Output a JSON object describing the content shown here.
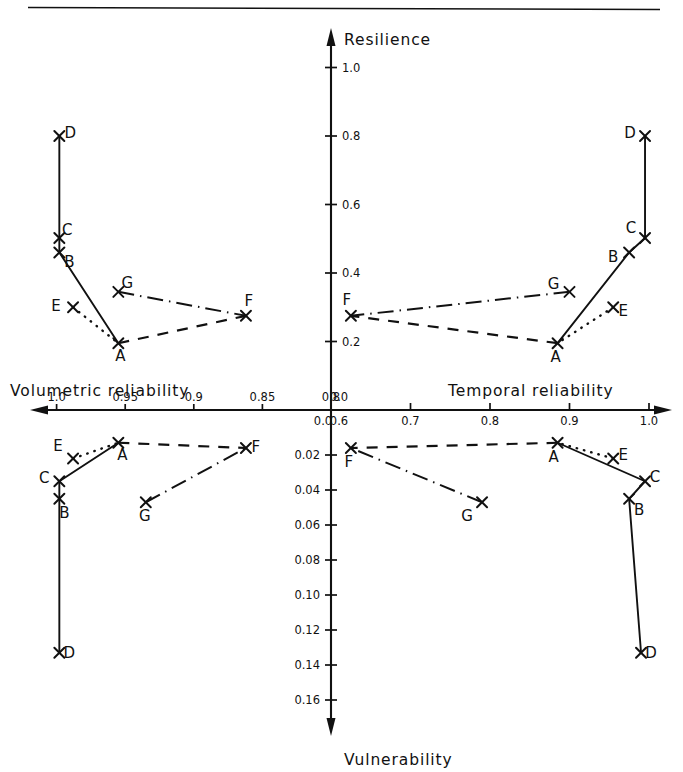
{
  "figure": {
    "title_resilience_axis": "Resilience",
    "title_vulnerability_axis": "Vulnerability",
    "title_left_x_axis": "Volumetric reliability",
    "title_right_x_axis": "Temporal reliability"
  },
  "axes": {
    "x_left_ticks": [
      "1.0",
      "0.95",
      "0.9",
      "0.85",
      "0.8"
    ],
    "x_right_ticks": [
      "0.6",
      "0.7",
      "0.8",
      "0.9",
      "1.0"
    ],
    "x_left_origin_extra": "0.0",
    "x_right_origin_extra": "0.0",
    "y_up_ticks": [
      "0.2",
      "0.4",
      "0.6",
      "0.8",
      "1.0"
    ],
    "y_down_ticks": [
      "0.02",
      "0.04",
      "0.06",
      "0.08",
      "0.10",
      "0.12",
      "0.14",
      "0.16"
    ]
  },
  "point_labels": [
    "A",
    "B",
    "C",
    "D",
    "E",
    "F",
    "G"
  ],
  "chart_data": {
    "type": "scatter",
    "title": "",
    "layout": "four-quadrant shared-origin scatter with connecting polylines",
    "grid": false,
    "legend": "none",
    "quadrants": [
      {
        "name": "upper-left",
        "xlabel": "Volumetric reliability",
        "ylabel": "Resilience",
        "xlim": [
          1.0,
          0.8
        ],
        "x_direction": "decreasing-left-to-right",
        "ylim": [
          0.0,
          1.0
        ],
        "xticks": [
          1.0,
          0.95,
          0.9,
          0.85,
          0.8
        ],
        "yticks": [
          0.0,
          0.2,
          0.4,
          0.6,
          0.8,
          1.0
        ],
        "points": [
          {
            "label": "A",
            "x": 0.955,
            "y": 0.195
          },
          {
            "label": "B",
            "x": 0.998,
            "y": 0.46
          },
          {
            "label": "C",
            "x": 0.998,
            "y": 0.502
          },
          {
            "label": "D",
            "x": 0.998,
            "y": 0.8
          },
          {
            "label": "E",
            "x": 0.988,
            "y": 0.3
          },
          {
            "label": "F",
            "x": 0.862,
            "y": 0.275
          },
          {
            "label": "G",
            "x": 0.955,
            "y": 0.345
          }
        ],
        "connections": [
          {
            "style": "solid",
            "path": [
              "D",
              "C",
              "B",
              "A"
            ]
          },
          {
            "style": "dotted",
            "path": [
              "E",
              "A"
            ]
          },
          {
            "style": "dashed",
            "path": [
              "A",
              "F"
            ]
          },
          {
            "style": "dashdot",
            "path": [
              "G",
              "F"
            ]
          }
        ]
      },
      {
        "name": "upper-right",
        "xlabel": "Temporal reliability",
        "ylabel": "Resilience",
        "xlim": [
          0.6,
          1.0
        ],
        "x_direction": "increasing-left-to-right",
        "ylim": [
          0.0,
          1.0
        ],
        "xticks": [
          0.6,
          0.7,
          0.8,
          0.9,
          1.0
        ],
        "yticks": [
          0.0,
          0.2,
          0.4,
          0.6,
          0.8,
          1.0
        ],
        "points": [
          {
            "label": "A",
            "x": 0.885,
            "y": 0.195
          },
          {
            "label": "B",
            "x": 0.975,
            "y": 0.46
          },
          {
            "label": "C",
            "x": 0.995,
            "y": 0.502
          },
          {
            "label": "D",
            "x": 0.995,
            "y": 0.8
          },
          {
            "label": "E",
            "x": 0.955,
            "y": 0.3
          },
          {
            "label": "F",
            "x": 0.625,
            "y": 0.275
          },
          {
            "label": "G",
            "x": 0.9,
            "y": 0.345
          }
        ],
        "connections": [
          {
            "style": "solid",
            "path": [
              "D",
              "C",
              "B",
              "A"
            ]
          },
          {
            "style": "dotted",
            "path": [
              "E",
              "A"
            ]
          },
          {
            "style": "dashed",
            "path": [
              "A",
              "F"
            ]
          },
          {
            "style": "dashdot",
            "path": [
              "G",
              "F"
            ]
          }
        ]
      },
      {
        "name": "lower-left",
        "xlabel": "Volumetric reliability",
        "ylabel": "Vulnerability",
        "xlim": [
          1.0,
          0.8
        ],
        "x_direction": "decreasing-left-to-right",
        "ylim": [
          0.0,
          0.17
        ],
        "y_direction": "increasing-downward",
        "xticks": [
          1.0,
          0.95,
          0.9,
          0.85,
          0.8
        ],
        "yticks": [
          0.0,
          0.02,
          0.04,
          0.06,
          0.08,
          0.1,
          0.12,
          0.14,
          0.16
        ],
        "points": [
          {
            "label": "A",
            "x": 0.955,
            "y": 0.013
          },
          {
            "label": "B",
            "x": 0.998,
            "y": 0.045
          },
          {
            "label": "C",
            "x": 0.998,
            "y": 0.035
          },
          {
            "label": "D",
            "x": 0.998,
            "y": 0.133
          },
          {
            "label": "E",
            "x": 0.988,
            "y": 0.022
          },
          {
            "label": "F",
            "x": 0.862,
            "y": 0.016
          },
          {
            "label": "G",
            "x": 0.935,
            "y": 0.047
          }
        ],
        "connections": [
          {
            "style": "solid",
            "path": [
              "D",
              "B",
              "C",
              "A"
            ]
          },
          {
            "style": "dotted",
            "path": [
              "E",
              "A"
            ]
          },
          {
            "style": "dashed",
            "path": [
              "A",
              "F"
            ]
          },
          {
            "style": "dashdot",
            "path": [
              "G",
              "F"
            ]
          }
        ]
      },
      {
        "name": "lower-right",
        "xlabel": "Temporal reliability",
        "ylabel": "Vulnerability",
        "xlim": [
          0.6,
          1.0
        ],
        "x_direction": "increasing-left-to-right",
        "ylim": [
          0.0,
          0.17
        ],
        "y_direction": "increasing-downward",
        "xticks": [
          0.6,
          0.7,
          0.8,
          0.9,
          1.0
        ],
        "yticks": [
          0.0,
          0.02,
          0.04,
          0.06,
          0.08,
          0.1,
          0.12,
          0.14,
          0.16
        ],
        "points": [
          {
            "label": "A",
            "x": 0.885,
            "y": 0.013
          },
          {
            "label": "B",
            "x": 0.975,
            "y": 0.045
          },
          {
            "label": "C",
            "x": 0.995,
            "y": 0.035
          },
          {
            "label": "D",
            "x": 0.99,
            "y": 0.133
          },
          {
            "label": "E",
            "x": 0.955,
            "y": 0.022
          },
          {
            "label": "F",
            "x": 0.625,
            "y": 0.016
          },
          {
            "label": "G",
            "x": 0.79,
            "y": 0.047
          }
        ],
        "connections": [
          {
            "style": "solid",
            "path": [
              "D",
              "B",
              "C",
              "A"
            ]
          },
          {
            "style": "dotted",
            "path": [
              "E",
              "A"
            ]
          },
          {
            "style": "dashed",
            "path": [
              "A",
              "F"
            ]
          },
          {
            "style": "dashdot",
            "path": [
              "G",
              "F"
            ]
          }
        ]
      }
    ]
  }
}
